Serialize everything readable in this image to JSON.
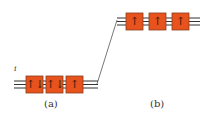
{
  "diagram": {
    "colors": {
      "box_fill": "#e8521c",
      "box_stroke": "#7a3a20",
      "line": "#444444",
      "arrow": "#3a1a10"
    },
    "panel_a": {
      "label": "(a)",
      "site_index_label": "i",
      "sites": [
        {
          "spins": "up-down",
          "glyph": "↑↓"
        },
        {
          "spins": "up-down",
          "glyph": "↑↓"
        },
        {
          "spins": "up",
          "glyph": "↑"
        }
      ]
    },
    "panel_b": {
      "label": "(b)",
      "sites": [
        {
          "spins": "up",
          "glyph": "↑"
        },
        {
          "spins": "up",
          "glyph": "↑"
        },
        {
          "spins": "up",
          "glyph": "↑"
        }
      ]
    }
  }
}
